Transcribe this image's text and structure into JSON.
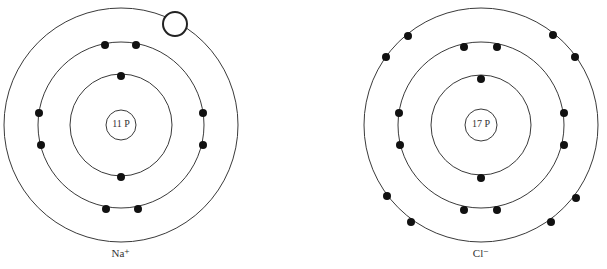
{
  "diagram": {
    "atoms": [
      {
        "id": "sodium-ion",
        "label": "Na⁺",
        "nucleus_label": "11 P",
        "center": [
          121,
          125
        ],
        "nucleus_radius": 15,
        "shells": [
          {
            "radius": 51,
            "electrons": 2
          },
          {
            "radius": 83,
            "electrons": 8
          },
          {
            "radius": 117,
            "electrons": 0,
            "vacancy": true
          }
        ]
      },
      {
        "id": "chloride-ion",
        "label": "Cl⁻",
        "nucleus_label": "17 P",
        "center": [
          481,
          125
        ],
        "nucleus_radius": 16,
        "shells": [
          {
            "radius": 50,
            "electrons": 2
          },
          {
            "radius": 83,
            "electrons": 8
          },
          {
            "radius": 117,
            "electrons": 8
          }
        ]
      }
    ]
  }
}
